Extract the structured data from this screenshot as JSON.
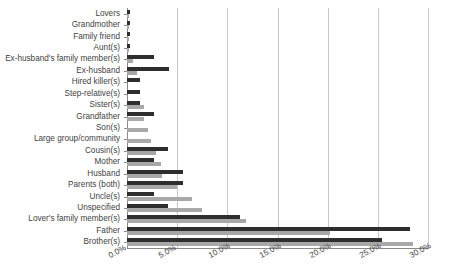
{
  "chart_data": {
    "type": "bar",
    "orientation": "horizontal",
    "title": "",
    "subtitle": "",
    "xlabel": "",
    "ylabel": "",
    "xlim": [
      0,
      30
    ],
    "xtick_labels": [
      "0.0%",
      "5.0%",
      "10.0%",
      "15.0%",
      "20.0%",
      "25.0%",
      "30.0%"
    ],
    "xtick_values": [
      0,
      5,
      10,
      15,
      20,
      25,
      30
    ],
    "grid": true,
    "legend": "none",
    "categories": [
      "Lovers",
      "Grandmother",
      "Family friend",
      "Aunt(s)",
      "Ex-husband's family member(s)",
      "Ex-husband",
      "Hired killer(s)",
      "Step-relative(s)",
      "Sister(s)",
      "Grandfather",
      "Son(s)",
      "Large group/community",
      "Cousin(s)",
      "Mother",
      "Husband",
      "Parents (both)",
      "Uncle(s)",
      "Unspecified",
      "Lover's family member(s)",
      "Father",
      "Brother(s)"
    ],
    "series": [
      {
        "name": "series-1",
        "color": "#2e2e2e",
        "values": [
          0.3,
          0.3,
          0.3,
          0.3,
          2.7,
          4.2,
          1.3,
          1.3,
          1.3,
          2.7,
          0.0,
          0.0,
          4.1,
          2.7,
          5.6,
          5.6,
          2.7,
          4.1,
          11.3,
          28.2,
          25.4
        ]
      },
      {
        "name": "series-2",
        "color": "#a8a8a8",
        "values": [
          0.2,
          0.2,
          0.2,
          0.2,
          0.6,
          1.0,
          0.0,
          0.0,
          1.7,
          1.7,
          2.1,
          2.4,
          2.9,
          3.4,
          3.5,
          5.0,
          6.5,
          7.5,
          11.9,
          20.2,
          28.5
        ]
      }
    ]
  }
}
